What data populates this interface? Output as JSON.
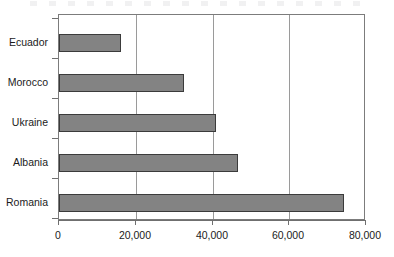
{
  "chart_data": {
    "type": "bar",
    "orientation": "horizontal",
    "title": "",
    "subtitle": "",
    "xlabel": "",
    "ylabel": "",
    "categories": [
      "Ecuador",
      "Morocco",
      "Ukraine",
      "Albania",
      "Romania"
    ],
    "values": [
      16100,
      32500,
      41000,
      46700,
      74300
    ],
    "series": [
      {
        "name": "",
        "values": [
          16100,
          32500,
          41000,
          46700,
          74300
        ]
      }
    ],
    "xlim": [
      0,
      80000
    ],
    "x_ticks": [
      0,
      20000,
      40000,
      60000,
      80000
    ],
    "x_tick_labels": [
      "0",
      "20,000",
      "40,000",
      "60,000",
      "80,000"
    ],
    "y_tick_labels": [
      "Ecuador",
      "Morocco",
      "Ukraine",
      "Albania",
      "Romania"
    ],
    "grid": {
      "vertical": true,
      "horizontal": false,
      "gridline_values": [
        20000,
        40000,
        60000
      ]
    },
    "legend": {
      "visible": false,
      "position": "none",
      "entries": []
    },
    "annotations": [],
    "data_labels_visible": false,
    "colors": {
      "bar_fill": "#838383",
      "bar_outline": "#3b3b3b",
      "gridline": "#9a9a9a",
      "frame": "#7c7c7c",
      "axis": "#6f6f6f",
      "text": "#1b1b1b",
      "background": "#ffffff"
    }
  }
}
